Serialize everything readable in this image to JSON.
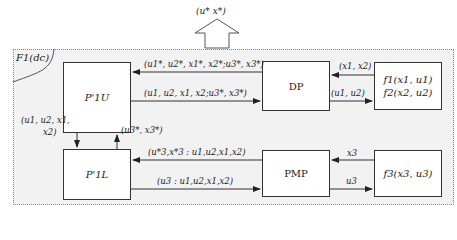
{
  "output": {
    "label": "(u* x*)"
  },
  "frame": {
    "corner_label": "F1(dc)"
  },
  "boxes": {
    "p1u": {
      "label": "P'1U"
    },
    "dp": {
      "label": "DP"
    },
    "f12": {
      "line1": "f1(x1, u1)",
      "line2": "f2(x2, u2)"
    },
    "p1l": {
      "label": "P'1L"
    },
    "pmp": {
      "label": "PMP"
    },
    "f3": {
      "label": "f3(x3, u3)"
    }
  },
  "edges": {
    "dp_to_p1u": "(u1*, u2*, x1*, x2*;u3*, x3*)",
    "p1u_to_dp": "(u1, u2, x1, x2;u3*, x3*)",
    "f12_to_dp": "(x1, x2)",
    "dp_to_f12": "(u1, u2)",
    "p1u_to_p1l_line1": "(u1, u2, x1,",
    "p1u_to_p1l_line2": "x2)",
    "p1l_to_p1u": "(u3*, x3*)",
    "pmp_to_p1l": "(u*3,x*3 : u1,u2,x1,x2)",
    "p1l_to_pmp": "(u3 : u1,u2,x1,x2)",
    "f3_to_pmp": "x3",
    "pmp_to_f3": "u3"
  }
}
